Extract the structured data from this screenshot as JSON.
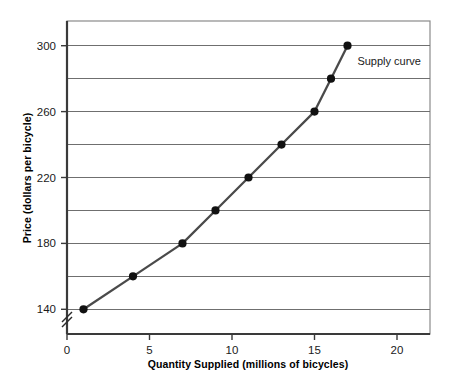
{
  "chart_data": {
    "type": "line",
    "title": "",
    "xlabel": "Quantity Supplied (millions of bicycles)",
    "ylabel": "Price (dollars per bicycle)",
    "x": [
      1,
      4,
      7,
      9,
      11,
      13,
      15,
      16,
      17
    ],
    "values": [
      140,
      160,
      180,
      200,
      220,
      240,
      260,
      280,
      300
    ],
    "series": [
      {
        "name": "Supply curve",
        "x": [
          1,
          4,
          7,
          9,
          11,
          13,
          15,
          16,
          17
        ],
        "values": [
          140,
          160,
          180,
          200,
          220,
          240,
          260,
          280,
          300
        ]
      }
    ],
    "xlim": [
      0,
      22
    ],
    "ylim": [
      125,
      315
    ],
    "xticks": [
      0,
      5,
      10,
      15,
      20
    ],
    "xtick_labels": [
      "0",
      "5",
      "10",
      "15",
      "20"
    ],
    "yticks": [
      140,
      180,
      220,
      260,
      300
    ],
    "ytick_labels": [
      "140",
      "180",
      "220",
      "260",
      "300"
    ],
    "gridlines_y": [
      140,
      160,
      180,
      200,
      220,
      240,
      260,
      280,
      300
    ],
    "grid": true,
    "grid_axis": "y",
    "legend": "none",
    "annotations": [
      {
        "text": "Supply curve",
        "x": 17.6,
        "y": 288
      }
    ],
    "axis_break": {
      "axis": "y",
      "symbol": "//",
      "position_y": 132
    },
    "colors": {
      "line": "#4a4a4a",
      "marker": "#111111",
      "grid": "#6f6f6f",
      "axis": "#3a3a3a",
      "frame": "#7a7a7a",
      "background": "#ffffff",
      "text": "#1a1a1a"
    }
  }
}
